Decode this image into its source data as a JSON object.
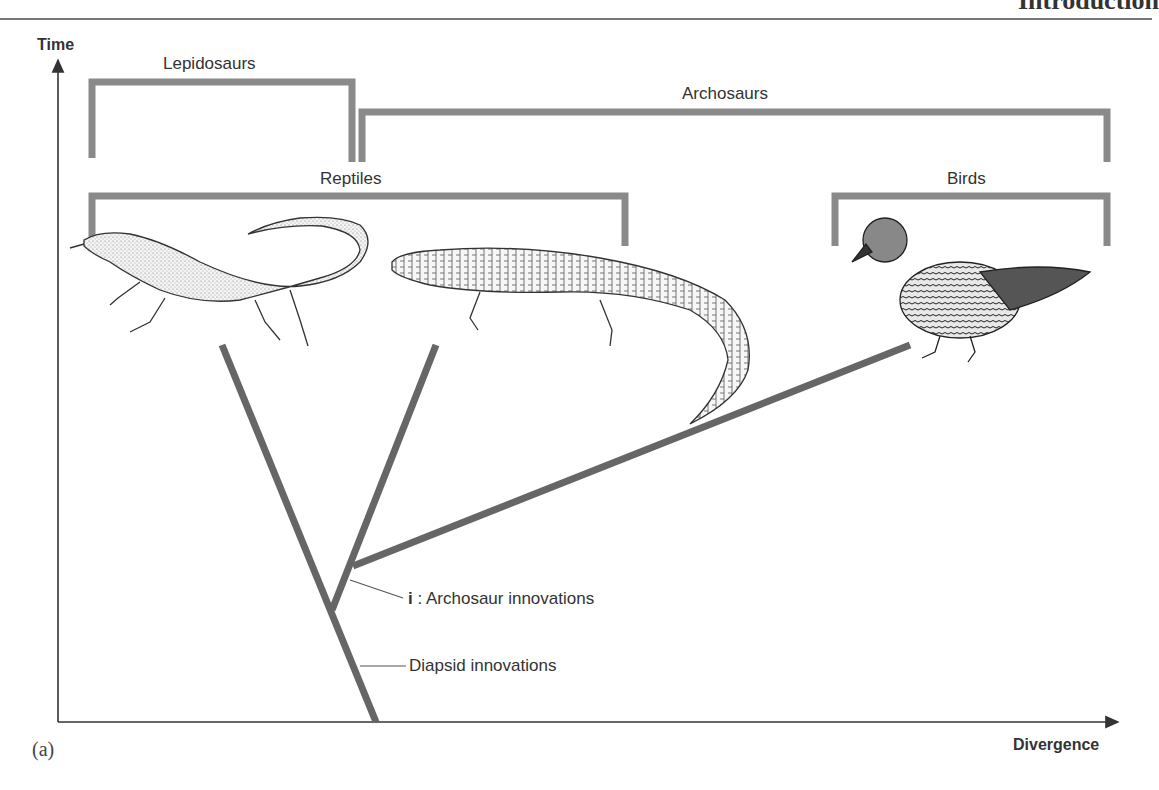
{
  "page": {
    "running_header": "Introduction",
    "figure_label": "(a)"
  },
  "axes": {
    "y_label": "Time",
    "x_label": "Divergence"
  },
  "groups": {
    "lepidosaurs": "Lepidosaurs",
    "archosaurs": "Archosaurs",
    "reptiles": "Reptiles",
    "birds": "Birds"
  },
  "annotations": {
    "archosaur_marker": "i",
    "archosaur_text": ": Archosaur innovations",
    "diapsid_text": "Diapsid innovations"
  },
  "organisms": [
    {
      "name": "lizard",
      "group": "Lepidosaurs"
    },
    {
      "name": "crocodile",
      "group": "Archosaurs"
    },
    {
      "name": "duck",
      "group": "Birds"
    }
  ],
  "colors": {
    "bracket": "#8a8a8a",
    "branch": "#666666",
    "axis": "#333333"
  }
}
